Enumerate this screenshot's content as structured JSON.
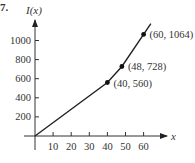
{
  "problem_number": "7.",
  "chart_data": {
    "type": "line",
    "title": "",
    "xlabel": "x",
    "ylabel": "I(x)",
    "x_ticks": [
      10,
      20,
      30,
      40,
      50,
      60
    ],
    "y_ticks": [
      200,
      400,
      600,
      800,
      1000
    ],
    "xlim": [
      0,
      70
    ],
    "ylim": [
      0,
      1150
    ],
    "grid": false,
    "series": [
      {
        "name": "I(x)",
        "x": [
          0,
          40,
          48,
          60,
          64
        ],
        "y": [
          0,
          560,
          728,
          1064,
          1176
        ]
      }
    ],
    "labeled_points": [
      {
        "x": 40,
        "y": 560,
        "label": "(40, 560)"
      },
      {
        "x": 48,
        "y": 728,
        "label": "(48, 728)"
      },
      {
        "x": 60,
        "y": 1064,
        "label": "(60, 1064)"
      }
    ]
  },
  "colors": {
    "line": "#222222",
    "axis": "#333333",
    "text": "#333333"
  }
}
